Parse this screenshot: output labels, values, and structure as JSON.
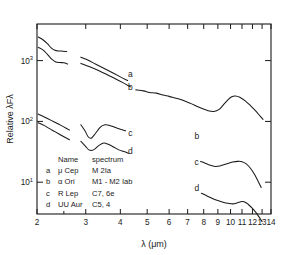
{
  "chart_data": {
    "type": "line",
    "title": "",
    "xlabel": "λ  (μm)",
    "ylabel": "Relative λFλ",
    "xscale": "log",
    "yscale": "log",
    "xlim": [
      2,
      14
    ],
    "ylim": [
      3,
      4000
    ],
    "grid": false,
    "legend_position": "inside-lower-left",
    "xticks": [
      "2",
      "3",
      "4",
      "5",
      "6",
      "7",
      "8",
      "9",
      "10",
      "11",
      "12",
      "13",
      "14"
    ],
    "yticks": [
      "10",
      "10",
      "10"
    ],
    "ytick_exponents": [
      "3",
      "2",
      "1"
    ],
    "ytick_values": [
      1000,
      100,
      10
    ],
    "legend": {
      "header_name": "Name",
      "header_spectrum": "spectrum",
      "rows": [
        {
          "key": "a",
          "name": "μ Cep",
          "spectrum": "M 2Ia"
        },
        {
          "key": "b",
          "name": "α Ori",
          "spectrum": "M1 - M2 Iab"
        },
        {
          "key": "c",
          "name": "R Lep",
          "spectrum": "C7, 6e"
        },
        {
          "key": "d",
          "name": "UU Aur",
          "spectrum": "C5, 4"
        }
      ]
    },
    "curve_labels": [
      {
        "key": "a",
        "x": 4.35,
        "y": 540
      },
      {
        "key": "b",
        "x": 4.35,
        "y": 330
      },
      {
        "key": "c",
        "x": 4.35,
        "y": 58
      },
      {
        "key": "d",
        "x": 4.35,
        "y": 29
      },
      {
        "key": "b",
        "x": 7.55,
        "y": 52
      },
      {
        "key": "c",
        "x": 7.55,
        "y": 19.5
      },
      {
        "key": "d",
        "x": 7.55,
        "y": 7.2
      }
    ],
    "series": [
      {
        "name": "a",
        "star": "μ Cep",
        "segments": [
          {
            "x": [
              2.02,
              2.1,
              2.18,
              2.25,
              2.32,
              2.4,
              2.48,
              2.56
            ],
            "y": [
              2450,
              2200,
              1900,
              1620,
              1480,
              1440,
              1430,
              1410
            ]
          },
          {
            "x": [
              2.88,
              3.05,
              3.25,
              3.5,
              3.75,
              4.0,
              4.25
            ],
            "y": [
              1140,
              1020,
              880,
              740,
              630,
              540,
              470
            ]
          }
        ]
      },
      {
        "name": "b",
        "star": "α Ori",
        "segments": [
          {
            "x": [
              2.02,
              2.1,
              2.18,
              2.26,
              2.34,
              2.42,
              2.5,
              2.58
            ],
            "y": [
              1650,
              1500,
              1270,
              1060,
              950,
              930,
              920,
              880
            ]
          },
          {
            "x": [
              2.88,
              3.1,
              3.35,
              3.6,
              3.85,
              4.1,
              4.35
            ],
            "y": [
              900,
              790,
              680,
              580,
              500,
              430,
              370
            ]
          },
          {
            "x": [
              4.55,
              4.85,
              5.1,
              5.4,
              5.7,
              6.0,
              6.3,
              6.6,
              6.9,
              7.2,
              7.55,
              7.9,
              8.3,
              8.7,
              9.1,
              9.45,
              9.8,
              10.1,
              10.4,
              10.8,
              11.3,
              11.8,
              12.3,
              12.8,
              13.1
            ],
            "y": [
              330,
              318,
              300,
              292,
              272,
              258,
              243,
              230,
              212,
              196,
              178,
              163,
              150,
              146,
              158,
              190,
              228,
              255,
              262,
              250,
              218,
              182,
              150,
              122,
              108
            ]
          }
        ]
      },
      {
        "name": "c",
        "star": "R Lep",
        "segments": [
          {
            "x": [
              2.02,
              2.1,
              2.18,
              2.26,
              2.34,
              2.44,
              2.54,
              2.62
            ],
            "y": [
              132,
              122,
              112,
              103,
              95,
              86,
              78,
              72
            ]
          },
          {
            "x": [
              2.88,
              2.98,
              3.06,
              3.14,
              3.24,
              3.38,
              3.52,
              3.66,
              3.82,
              4.0,
              4.18
            ],
            "y": [
              88,
              70,
              56,
              53,
              62,
              80,
              88,
              86,
              80,
              74,
              70
            ]
          },
          {
            "x": [
              7.8,
              8.1,
              8.45,
              8.8,
              9.15,
              9.5,
              9.85,
              10.2,
              10.6,
              11.0,
              11.4,
              11.8,
              12.2,
              12.6,
              12.9
            ],
            "y": [
              22,
              20.5,
              19.0,
              18.2,
              18.5,
              19.5,
              20.5,
              21.5,
              22.0,
              21.8,
              20.0,
              17.0,
              13.5,
              10.2,
              8.2
            ]
          }
        ]
      },
      {
        "name": "d",
        "star": "UU Aur",
        "segments": [
          {
            "x": [
              2.02,
              2.12,
              2.22,
              2.32,
              2.42,
              2.52,
              2.62
            ],
            "y": [
              95,
              86,
              76,
              68,
              61,
              55,
              50
            ]
          },
          {
            "x": [
              2.88,
              2.98,
              3.08,
              3.2,
              3.34,
              3.48,
              3.62,
              3.78,
              3.95,
              4.12,
              4.28
            ],
            "y": [
              47,
              40,
              34,
              34,
              40,
              44,
              42,
              38,
              34,
              32,
              30
            ]
          },
          {
            "x": [
              7.85,
              8.2,
              8.6,
              9.0,
              9.4,
              9.8,
              10.2,
              10.6,
              11.0,
              11.3,
              11.6,
              12.0,
              12.4,
              12.8,
              13.0
            ],
            "y": [
              6.6,
              6.0,
              5.4,
              5.0,
              4.7,
              4.5,
              4.4,
              4.6,
              4.8,
              4.7,
              4.3,
              3.7,
              3.1,
              2.5,
              2.25
            ]
          }
        ]
      }
    ]
  }
}
